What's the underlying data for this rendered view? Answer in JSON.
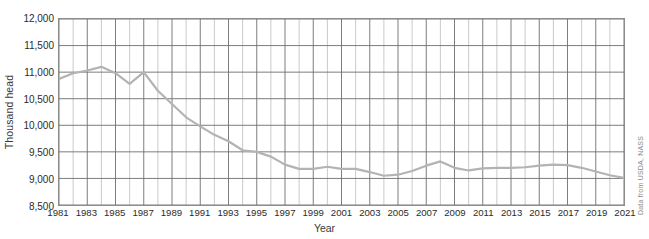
{
  "chart_data": {
    "type": "line",
    "title": "",
    "xlabel": "Year",
    "ylabel": "Thousand head",
    "ylim": [
      8500,
      12000
    ],
    "ytick_values": [
      8500,
      9000,
      9500,
      10000,
      10500,
      11000,
      11500,
      12000
    ],
    "ytick_labels": [
      "8,500",
      "9,000",
      "9,500",
      "10,000",
      "10,500",
      "11,000",
      "11,500",
      "12,000"
    ],
    "xlim": [
      1981,
      2021
    ],
    "xtick_values": [
      1981,
      1983,
      1985,
      1987,
      1989,
      1991,
      1993,
      1995,
      1997,
      1999,
      2001,
      2003,
      2005,
      2007,
      2009,
      2011,
      2013,
      2015,
      2017,
      2019,
      2021
    ],
    "xtick_labels": [
      "1981",
      "1983",
      "1985",
      "1987",
      "1989",
      "1991",
      "1993",
      "1995",
      "1997",
      "1999",
      "2001",
      "2003",
      "2005",
      "2007",
      "2009",
      "2011",
      "2013",
      "2015",
      "2017",
      "2019",
      "2021"
    ],
    "grid": true,
    "grid_x_every": 1,
    "grid_y_every": 500,
    "legend": "none",
    "line_color": "#b3b3b3",
    "grid_color": "#6e6e6e",
    "grid_minor_color": "#bdbdbd",
    "border_color": "#8c8c8c",
    "annotation": "Data from USDA, NASS",
    "x": [
      1981,
      1982,
      1983,
      1984,
      1985,
      1986,
      1987,
      1988,
      1989,
      1990,
      1991,
      1992,
      1993,
      1994,
      1995,
      1996,
      1997,
      1998,
      1999,
      2000,
      2001,
      2002,
      2003,
      2004,
      2005,
      2006,
      2007,
      2008,
      2009,
      2010,
      2011,
      2012,
      2013,
      2014,
      2015,
      2016,
      2017,
      2018,
      2019,
      2020,
      2021
    ],
    "values": [
      10870,
      10980,
      11030,
      11100,
      10980,
      10780,
      11000,
      10650,
      10400,
      10150,
      9980,
      9820,
      9700,
      9530,
      9500,
      9410,
      9260,
      9180,
      9180,
      9220,
      9180,
      9180,
      9120,
      9050,
      9070,
      9140,
      9240,
      9320,
      9200,
      9150,
      9190,
      9200,
      9200,
      9210,
      9240,
      9260,
      9250,
      9200,
      9130,
      9060,
      9010
    ]
  }
}
